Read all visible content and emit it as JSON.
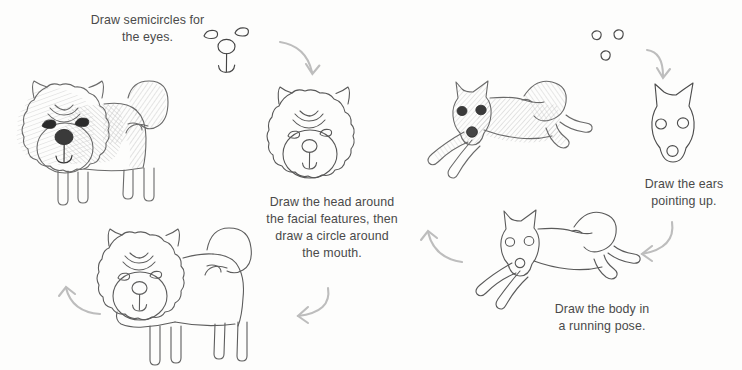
{
  "page": {
    "background_color": "#fdfdfc",
    "ink_color": "#3c3c3c",
    "arrow_color": "#b6b6b6",
    "text_color": "#4a4a4a",
    "width": 742,
    "height": 370
  },
  "captions": [
    {
      "id": "caption-eyes",
      "text": "Draw semicircles for\nthe eyes.",
      "x": 75,
      "y": 12,
      "width": 145
    },
    {
      "id": "caption-head",
      "text": "Draw the head around\nthe facial features, then\ndraw a circle around\nthe mouth.",
      "x": 256,
      "y": 194,
      "width": 152
    },
    {
      "id": "caption-ears",
      "text": "Draw the ears\npointing up.",
      "x": 632,
      "y": 176,
      "width": 104
    },
    {
      "id": "caption-body",
      "text": "Draw the body in\na running pose.",
      "x": 540,
      "y": 301,
      "width": 124
    }
  ],
  "steps": [
    {
      "id": "step-1-face-features",
      "label": "facial features: two semicircle eyes, circle nose, mouth line",
      "order": 1
    },
    {
      "id": "step-2-fluffy-head",
      "label": "fluffy head outline around the facial features with muzzle circle",
      "order": 2
    },
    {
      "id": "step-3-fluffy-body-outline",
      "label": "full fluffy dog body outline with tail and four legs",
      "order": 3
    },
    {
      "id": "step-4-fluffy-dog-shaded",
      "label": "finished shaded fluffy dog with dark eyes and nose",
      "order": 4
    },
    {
      "id": "step-5-circles",
      "label": "three small circles for eyes and nose",
      "order": 5
    },
    {
      "id": "step-6-pointed-head",
      "label": "pointed head with ears pointing up",
      "order": 6
    },
    {
      "id": "step-7-running-body",
      "label": "running pose body outline",
      "order": 7
    },
    {
      "id": "step-8-running-dog-shaded",
      "label": "finished shaded running dog",
      "order": 8
    }
  ],
  "arrows": [
    {
      "id": "arrow-top-left",
      "direction": "down-right",
      "x": 278,
      "y": 38
    },
    {
      "id": "arrow-top-right",
      "direction": "down",
      "x": 645,
      "y": 48
    },
    {
      "id": "arrow-right-down",
      "direction": "down-left",
      "x": 628,
      "y": 222
    },
    {
      "id": "arrow-middle-up",
      "direction": "up-left",
      "x": 418,
      "y": 222
    },
    {
      "id": "arrow-bottom-left",
      "direction": "down-left",
      "x": 288,
      "y": 288
    },
    {
      "id": "arrow-far-left",
      "direction": "up-left",
      "x": 58,
      "y": 282
    }
  ]
}
